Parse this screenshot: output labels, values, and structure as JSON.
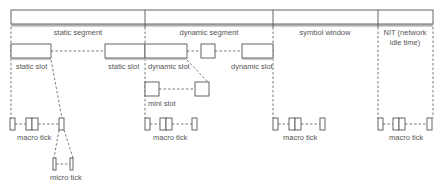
{
  "diagram": {
    "segments": [
      {
        "label": "static segment"
      },
      {
        "label": "dynamic segment"
      },
      {
        "label": "symbol window"
      },
      {
        "label": "NIT (network",
        "label2": "idle time)"
      }
    ],
    "slots": {
      "static_slot_1": "static slot",
      "static_slot_2": "static slot",
      "dynamic_slot_1": "dynamic slot",
      "dynamic_slot_2": "dynamic slot",
      "mini_slot": "mini slot"
    },
    "ticks": {
      "macro_tick_1": "macro tick",
      "macro_tick_2": "macro tick",
      "macro_tick_3": "macro tick",
      "macro_tick_4": "macro tick",
      "micro_tick": "micro tick"
    },
    "colors": {
      "line": "#555555",
      "fill": "#ffffff"
    }
  }
}
